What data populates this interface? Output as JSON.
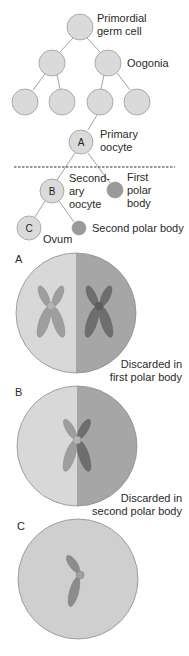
{
  "colors": {
    "cell_fill": "#dadada",
    "cell_stroke": "#9c9c9c",
    "polar_body_fill": "#9a9a9a",
    "line": "#8a8a8a",
    "dashed_line": "#333333",
    "panel_light": "#d8d8d8",
    "panel_dark": "#a6a6a6",
    "chromosome_light": "#9e9e9e",
    "chromosome_dark": "#6e6e6e",
    "panel_c_fill": "#cfcfcf"
  },
  "lineage": {
    "primordial": {
      "line1": "Primordial",
      "line2": "germ cell"
    },
    "oogonia": {
      "label": "Oogonia"
    },
    "primary_oocyte": {
      "letter": "A",
      "line1": "Primary",
      "line2": "oocyte"
    },
    "secondary_oocyte": {
      "letter": "B",
      "line1": "Second-",
      "line2": "ary",
      "line3": "oocyte"
    },
    "first_polar_body": {
      "line1": "First",
      "line2": "polar",
      "line3": "body"
    },
    "ovum": {
      "letter": "C",
      "label": "Ovum"
    },
    "second_polar_body": {
      "label": "Second polar body"
    }
  },
  "panels": [
    {
      "letter": "A",
      "caption_line1": "Discarded in",
      "caption_line2": "first polar body"
    },
    {
      "letter": "B",
      "caption_line1": "Discarded in",
      "caption_line2": "second polar body"
    },
    {
      "letter": "C"
    }
  ]
}
